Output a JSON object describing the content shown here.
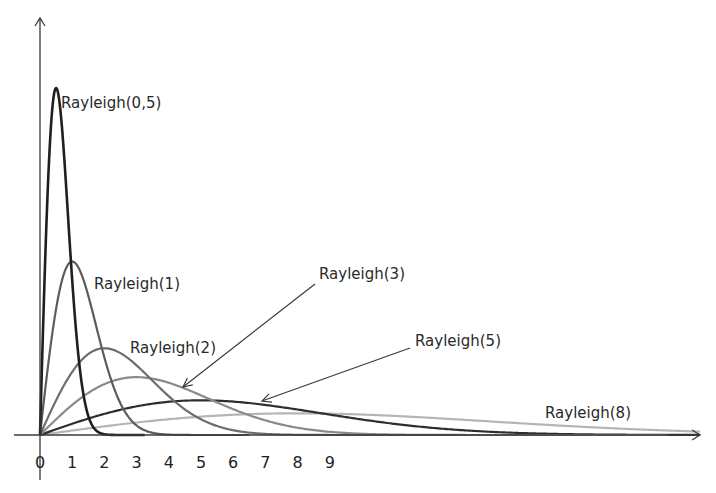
{
  "chart_data": {
    "type": "line",
    "title": "",
    "xlabel": "",
    "ylabel": "",
    "x_ticks": [
      "0",
      "1",
      "2",
      "3",
      "4",
      "5",
      "6",
      "7",
      "8",
      "9"
    ],
    "xlim": [
      0,
      20.5
    ],
    "ylim": [
      0,
      1.35
    ],
    "grid": false,
    "legend": "inline labels",
    "formula": "f(x) = x/σ² · exp(-x²/(2σ²))",
    "series": [
      {
        "name": "Rayleigh(0,5)",
        "sigma": 0.5,
        "color": "#1f1f1f",
        "peak_x": 0.5,
        "peak_y": 1.213,
        "label_pos": [
          61,
          108
        ],
        "arrow": null
      },
      {
        "name": "Rayleigh(1)",
        "sigma": 1,
        "color": "#5c5c5c",
        "peak_x": 1,
        "peak_y": 0.607,
        "label_pos": [
          94,
          289
        ],
        "arrow": null
      },
      {
        "name": "Rayleigh(2)",
        "sigma": 2,
        "color": "#6e6e6e",
        "peak_x": 2,
        "peak_y": 0.303,
        "label_pos": [
          130,
          353
        ],
        "arrow": null
      },
      {
        "name": "Rayleigh(3)",
        "sigma": 3,
        "color": "#8a8a8a",
        "peak_x": 3,
        "peak_y": 0.202,
        "label_pos": [
          319,
          279
        ],
        "arrow": [
          315,
          284,
          183,
          387
        ]
      },
      {
        "name": "Rayleigh(5)",
        "sigma": 5,
        "color": "#2e2e2e",
        "peak_x": 5,
        "peak_y": 0.121,
        "label_pos": [
          415,
          346
        ],
        "arrow": [
          410,
          348,
          262,
          401
        ]
      },
      {
        "name": "Rayleigh(8)",
        "sigma": 8,
        "color": "#b5b5b5",
        "peak_x": 8,
        "peak_y": 0.076,
        "label_pos": [
          545,
          418
        ],
        "arrow": null
      }
    ]
  },
  "axes": {
    "origin_px": [
      40,
      435
    ],
    "x_unit_px": 32.2,
    "y_unit_px": 286,
    "x_end_px": 700,
    "y_top_px": 18,
    "y_bottom_px": 480,
    "x_start_px": 14,
    "color": "#3a3a3a"
  }
}
